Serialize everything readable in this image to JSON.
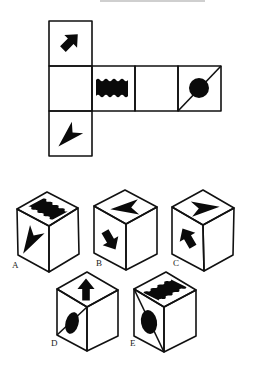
{
  "header": {
    "cutoff_text": ""
  },
  "net": {
    "description": "Unfolded cube net with six faces",
    "faces": [
      {
        "position": "top",
        "symbol": "thick-arrow-up-right"
      },
      {
        "position": "middle-left",
        "symbol": "blank"
      },
      {
        "position": "middle-2",
        "symbol": "wavy-rectangle"
      },
      {
        "position": "middle-3",
        "symbol": "blank"
      },
      {
        "position": "middle-right",
        "symbol": "circle-with-diagonal"
      },
      {
        "position": "bottom",
        "symbol": "chevron-arrowhead"
      }
    ]
  },
  "options": [
    {
      "label": "A",
      "top": "wavy-rectangle",
      "left": "chevron-arrowhead",
      "right": "blank"
    },
    {
      "label": "B",
      "top": "chevron-arrowhead-left",
      "left": "thick-arrow-down-right",
      "right": "blank"
    },
    {
      "label": "C",
      "top": "chevron-arrowhead-right",
      "left": "thick-arrow-up-left",
      "right": "blank"
    },
    {
      "label": "D",
      "top": "thick-arrow-up",
      "left": "circle-with-diagonal",
      "right": "blank"
    },
    {
      "label": "E",
      "top": "wavy-rectangle",
      "left": "circle-with-diagonal",
      "right": "blank"
    }
  ]
}
